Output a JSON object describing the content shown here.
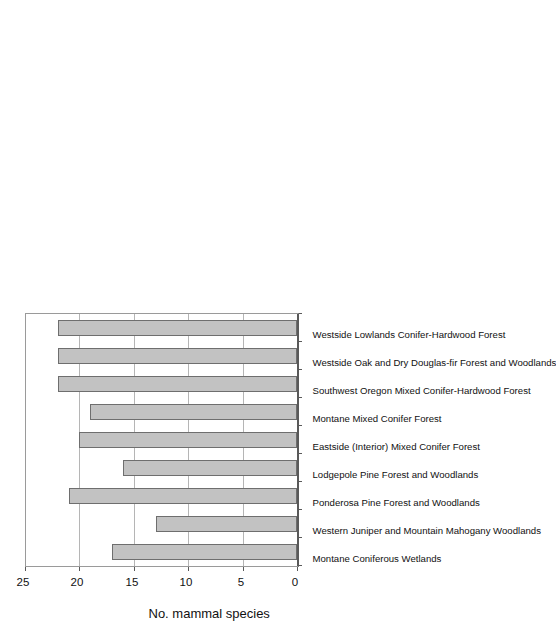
{
  "chart_data": {
    "type": "bar",
    "orientation": "horizontal",
    "title": "",
    "xlabel": "",
    "ylabel": "No. mammal species",
    "ylim": [
      0,
      25
    ],
    "yticks": [
      0,
      5,
      10,
      15,
      20,
      25
    ],
    "grid": true,
    "legend": false,
    "bar_color": "#c2c2c2",
    "bar_edge_color": "#6e6e6e",
    "categories": [
      "Montane Coniferous Wetlands",
      "Western Juniper and Mountain Mahogany Woodlands",
      "Ponderosa Pine Forest and Woodlands",
      "Lodgepole Pine Forest and Woodlands",
      "Eastside (Interior) Mixed Conifer Forest",
      "Montane Mixed Conifer Forest",
      "Southwest Oregon Mixed Conifer-Hardwood Forest",
      "Westside Oak and Dry Douglas-fir Forest and Woodlands",
      "Westside Lowlands Conifer-Hardwood Forest"
    ],
    "values": [
      17,
      13,
      21,
      16,
      20,
      19,
      22,
      22,
      22
    ]
  }
}
